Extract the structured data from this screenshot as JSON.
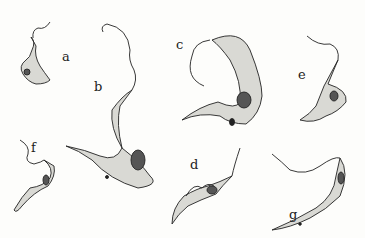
{
  "figure": {
    "labels": [
      {
        "id": "a",
        "text": "a",
        "x": 62,
        "y": 50
      },
      {
        "id": "b",
        "text": "b",
        "x": 94,
        "y": 80
      },
      {
        "id": "c",
        "text": "c",
        "x": 176,
        "y": 38
      },
      {
        "id": "d",
        "text": "d",
        "x": 190,
        "y": 158
      },
      {
        "id": "e",
        "text": "e",
        "x": 298,
        "y": 68
      },
      {
        "id": "f",
        "text": "f",
        "x": 31,
        "y": 141
      },
      {
        "id": "g",
        "text": "g",
        "x": 289,
        "y": 208
      }
    ],
    "colors": {
      "ink": "#222222",
      "cell": "#d9d9d4",
      "nucleus": "#555555",
      "background": "#fdfdfb"
    }
  }
}
